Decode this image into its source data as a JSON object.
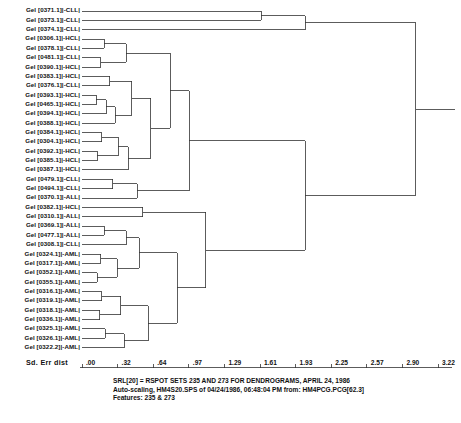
{
  "figure": {
    "axis_title": "Sd. Err dist",
    "axis_ticks": [
      ".00",
      ".32",
      ".64",
      ".97",
      "1.29",
      "1.61",
      "1.93",
      "2.25",
      "2.57",
      "2.90",
      "3.22"
    ],
    "caption": [
      "SRL[20] = RSPOT SETS 235 AND 273 FOR DENDROGRAMS, APRIL 24, 1986",
      "Auto-scaling, HM4S20.SPS of 04/24/1986, 06:48:04 PM from: HM4PCG.PCG[62.3]",
      "Features: 235 & 273"
    ],
    "line_color": "#333333",
    "text_color": "#111111"
  },
  "leaves": [
    {
      "label": "Gel [0371.1]|-CLL|",
      "class": "CLL"
    },
    {
      "label": "Gel [0373.1]|-CLL|",
      "class": "CLL"
    },
    {
      "label": "Gel [0374.1]|-CLL|",
      "class": "CLL"
    },
    {
      "label": "Gel [0306.1]|-HCL|",
      "class": "HCL"
    },
    {
      "label": "Gel [0378.1]|-CLL|",
      "class": "CLL"
    },
    {
      "label": "Gel [0481.1]|-CLL|",
      "class": "CLL"
    },
    {
      "label": "Gel [0390.1]|-HCL|",
      "class": "HCL"
    },
    {
      "label": "Gel [0383.1]|-HCL|",
      "class": "HCL"
    },
    {
      "label": "Gel [0376.1]|-CLL|",
      "class": "CLL"
    },
    {
      "label": "Gel [0393.1]|-HCL|",
      "class": "HCL"
    },
    {
      "label": "Gel [0465.1]|-HCL|",
      "class": "HCL"
    },
    {
      "label": "Gel [0394.1]|-HCL|",
      "class": "HCL"
    },
    {
      "label": "Gel [0388.1]|-HCL|",
      "class": "HCL"
    },
    {
      "label": "Gel [0384.1]|-HCL|",
      "class": "HCL"
    },
    {
      "label": "Gel [0304.1]|-HCL|",
      "class": "HCL"
    },
    {
      "label": "Gel [0392.1]|-HCL|",
      "class": "HCL"
    },
    {
      "label": "Gel [0385.1]|-HCL|",
      "class": "HCL"
    },
    {
      "label": "Gel [0387.1]|-HCL|",
      "class": "HCL"
    },
    {
      "label": "Gel [0479.1]|-CLL|",
      "class": "CLL"
    },
    {
      "label": "Gel [0494.1]|-CLL|",
      "class": "CLL"
    },
    {
      "label": "Gel [0370.1]|-ALL|",
      "class": "ALL"
    },
    {
      "label": "Gel [0382.1]|-HCL|",
      "class": "HCL"
    },
    {
      "label": "Gel [0310.1]|-ALL|",
      "class": "ALL"
    },
    {
      "label": "Gel [0369.1]|-ALL|",
      "class": "ALL"
    },
    {
      "label": "Gel [0477.1]|-ALL|",
      "class": "ALL"
    },
    {
      "label": "Gel [0308.1]|-CLL|",
      "class": "CLL"
    },
    {
      "label": "Gel [0324.1]|-AML|",
      "class": "AML"
    },
    {
      "label": "Gel [0317.1]|-AML|",
      "class": "AML"
    },
    {
      "label": "Gel [0352.1]|-AML|",
      "class": "AML"
    },
    {
      "label": "Gel [0355.1]|-AML|",
      "class": "AML"
    },
    {
      "label": "Gel [0316.1]|-AML|",
      "class": "AML"
    },
    {
      "label": "Gel [0319.1]|-AML|",
      "class": "AML"
    },
    {
      "label": "Gel [0318.1]|-AML|",
      "class": "AML"
    },
    {
      "label": "Gel [0336.1]|-AML|",
      "class": "AML"
    },
    {
      "label": "Gel [0325.1]|-AML|",
      "class": "AML"
    },
    {
      "label": "Gel [0326.1]|-AML|",
      "class": "AML"
    },
    {
      "label": "Gel [0322.2]|-AML|",
      "class": "AML"
    }
  ],
  "chart_data": {
    "type": "dendrogram",
    "title": "SRL[20] = RSPOT SETS 235 AND 273 FOR DENDROGRAMS, APRIL 24, 1986",
    "xlabel": "Sd. Err dist",
    "ylabel": "",
    "xlim": [
      0.0,
      3.22
    ],
    "xticks": [
      0.0,
      0.32,
      0.64,
      0.97,
      1.29,
      1.61,
      1.93,
      2.25,
      2.57,
      2.9,
      3.22
    ],
    "grid": false,
    "legend": "none",
    "orientation": "horizontal-left-to-right",
    "n_leaves": 37,
    "leaf_order": [
      "Gel [0371.1]|-CLL|",
      "Gel [0373.1]|-CLL|",
      "Gel [0374.1]|-CLL|",
      "Gel [0306.1]|-HCL|",
      "Gel [0378.1]|-CLL|",
      "Gel [0481.1]|-CLL|",
      "Gel [0390.1]|-HCL|",
      "Gel [0383.1]|-HCL|",
      "Gel [0376.1]|-CLL|",
      "Gel [0393.1]|-HCL|",
      "Gel [0465.1]|-HCL|",
      "Gel [0394.1]|-HCL|",
      "Gel [0388.1]|-HCL|",
      "Gel [0384.1]|-HCL|",
      "Gel [0304.1]|-HCL|",
      "Gel [0392.1]|-HCL|",
      "Gel [0385.1]|-HCL|",
      "Gel [0387.1]|-HCL|",
      "Gel [0479.1]|-CLL|",
      "Gel [0494.1]|-CLL|",
      "Gel [0370.1]|-ALL|",
      "Gel [0382.1]|-HCL|",
      "Gel [0310.1]|-ALL|",
      "Gel [0369.1]|-ALL|",
      "Gel [0477.1]|-ALL|",
      "Gel [0308.1]|-CLL|",
      "Gel [0324.1]|-AML|",
      "Gel [0317.1]|-AML|",
      "Gel [0352.1]|-AML|",
      "Gel [0355.1]|-AML|",
      "Gel [0316.1]|-AML|",
      "Gel [0319.1]|-AML|",
      "Gel [0318.1]|-AML|",
      "Gel [0336.1]|-AML|",
      "Gel [0325.1]|-AML|",
      "Gel [0326.1]|-AML|",
      "Gel [0322.2]|-AML|"
    ],
    "merges": [
      {
        "id": "n1",
        "left": "leaf:3",
        "right": "leaf:4",
        "height": 0.2
      },
      {
        "id": "n2",
        "left": "leaf:5",
        "right": "leaf:6",
        "height": 0.17
      },
      {
        "id": "n3",
        "left": "n1",
        "right": "n2",
        "height": 0.4
      },
      {
        "id": "n4",
        "left": "leaf:7",
        "right": "leaf:8",
        "height": 0.25
      },
      {
        "id": "n5",
        "left": "leaf:9",
        "right": "leaf:10",
        "height": 0.13
      },
      {
        "id": "n6",
        "left": "n5",
        "right": "leaf:11",
        "height": 0.22
      },
      {
        "id": "n7",
        "left": "n6",
        "right": "leaf:12",
        "height": 0.3
      },
      {
        "id": "n8",
        "left": "n4",
        "right": "n7",
        "height": 0.45
      },
      {
        "id": "n9",
        "left": "leaf:13",
        "right": "leaf:14",
        "height": 0.18
      },
      {
        "id": "n10",
        "left": "leaf:15",
        "right": "leaf:16",
        "height": 0.14
      },
      {
        "id": "n11",
        "left": "n9",
        "right": "n10",
        "height": 0.33
      },
      {
        "id": "n12",
        "left": "n11",
        "right": "leaf:17",
        "height": 0.42
      },
      {
        "id": "n13",
        "left": "n8",
        "right": "n12",
        "height": 0.62
      },
      {
        "id": "n14",
        "left": "n3",
        "right": "n13",
        "height": 0.8
      },
      {
        "id": "n15",
        "left": "leaf:18",
        "right": "leaf:19",
        "height": 0.28
      },
      {
        "id": "n16",
        "left": "n15",
        "right": "leaf:20",
        "height": 0.5
      },
      {
        "id": "n17",
        "left": "n14",
        "right": "n16",
        "height": 0.97
      },
      {
        "id": "n18",
        "left": "leaf:21",
        "right": "leaf:22",
        "height": 0.55
      },
      {
        "id": "n19",
        "left": "leaf:23",
        "right": "leaf:24",
        "height": 0.2
      },
      {
        "id": "n20",
        "left": "n19",
        "right": "leaf:25",
        "height": 0.4
      },
      {
        "id": "n21",
        "left": "leaf:26",
        "right": "leaf:27",
        "height": 0.17
      },
      {
        "id": "n22",
        "left": "leaf:28",
        "right": "leaf:29",
        "height": 0.14
      },
      {
        "id": "n23",
        "left": "n21",
        "right": "n22",
        "height": 0.32
      },
      {
        "id": "n24",
        "left": "n20",
        "right": "n23",
        "height": 0.52
      },
      {
        "id": "n25",
        "left": "leaf:30",
        "right": "leaf:31",
        "height": 0.18
      },
      {
        "id": "n26",
        "left": "leaf:32",
        "right": "leaf:33",
        "height": 0.16
      },
      {
        "id": "n27",
        "left": "n25",
        "right": "n26",
        "height": 0.35
      },
      {
        "id": "n28",
        "left": "leaf:34",
        "right": "leaf:35",
        "height": 0.21
      },
      {
        "id": "n29",
        "left": "n28",
        "right": "leaf:36",
        "height": 0.38
      },
      {
        "id": "n30",
        "left": "n27",
        "right": "n29",
        "height": 0.6
      },
      {
        "id": "n31",
        "left": "n24",
        "right": "n30",
        "height": 0.86
      },
      {
        "id": "n32",
        "left": "n18",
        "right": "n31",
        "height": 1.12
      },
      {
        "id": "n33",
        "left": "n17",
        "right": "n32",
        "height": 2.02
      },
      {
        "id": "n34",
        "left": "leaf:0",
        "right": "leaf:1",
        "height": 1.62
      },
      {
        "id": "n35",
        "left": "n34",
        "right": "leaf:2",
        "height": 2.02
      },
      {
        "id": "n36",
        "left": "n35",
        "right": "n33",
        "height": 3.02
      }
    ]
  }
}
